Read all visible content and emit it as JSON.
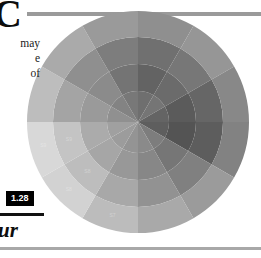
{
  "page": {
    "dropcap": "C",
    "body_lines": [
      "may",
      "e",
      "of"
    ],
    "caption_fragment": "ur"
  },
  "figure": {
    "number_label": "1.28"
  },
  "colors": {
    "rule_gray": "#9a9a9a",
    "rule_black": "#111111",
    "badge_bg": "#000000",
    "badge_fg": "#ffffff",
    "page_bg": "#ffffff"
  },
  "chart_data": {
    "type": "pie",
    "subtype": "polar-area-rings",
    "title": "",
    "subtitle": "",
    "xlabel": "",
    "ylabel": "",
    "grid": false,
    "legend_position": "none",
    "center": [
      138,
      122
    ],
    "outer_radius": 111,
    "ring_radii": [
      31,
      58,
      85,
      111
    ],
    "sector_count": 12,
    "ring_count": 4,
    "sector_angle_deg": 30,
    "start_angle_deg": -90,
    "categories": [
      "S1",
      "S2",
      "S3",
      "S4",
      "S5",
      "S6",
      "S7",
      "S8",
      "S9",
      "S10",
      "S11",
      "S12"
    ],
    "ring_names": [
      "Ring 1 (inner)",
      "Ring 2",
      "Ring 3",
      "Ring 4 (outer)"
    ],
    "series": [
      {
        "name": "Ring 1 (inner)",
        "values": [
          62,
          58,
          70,
          74,
          52,
          46,
          40,
          36,
          34,
          42,
          50,
          56
        ],
        "colors": [
          "#6f6f6f",
          "#757575",
          "#646464",
          "#5e5e5e",
          "#7d7d7d",
          "#8a8a8a",
          "#949494",
          "#9c9c9c",
          "#a0a0a0",
          "#909090",
          "#838383",
          "#787878"
        ]
      },
      {
        "name": "Ring 2",
        "values": [
          72,
          66,
          78,
          84,
          60,
          50,
          42,
          38,
          36,
          46,
          56,
          64
        ],
        "colors": [
          "#636363",
          "#6b6b6b",
          "#5b5b5b",
          "#545454",
          "#767676",
          "#878787",
          "#989898",
          "#a6a6a6",
          "#ababab",
          "#9a9a9a",
          "#8b8b8b",
          "#747474"
        ]
      },
      {
        "name": "Ring 3",
        "values": [
          80,
          74,
          86,
          92,
          66,
          54,
          44,
          34,
          30,
          48,
          60,
          70
        ],
        "colors": [
          "#707070",
          "#777777",
          "#666666",
          "#5d5d5d",
          "#808080",
          "#929292",
          "#a8a8a8",
          "#bdbdbd",
          "#c4c4c4",
          "#a4a4a4",
          "#8f8f8f",
          "#7d7d7d"
        ]
      },
      {
        "name": "Ring 4 (outer)",
        "values": [
          88,
          82,
          94,
          98,
          72,
          58,
          46,
          30,
          26,
          50,
          64,
          76
        ],
        "colors": [
          "#8f8f8f",
          "#969696",
          "#888888",
          "#828282",
          "#9b9b9b",
          "#a9a9a9",
          "#bcbcbc",
          "#d2d2d2",
          "#d8d8d8",
          "#bdbdbd",
          "#aaaaaa",
          "#9a9a9a"
        ]
      }
    ],
    "annotations": [
      "illegible in-cell labels"
    ]
  }
}
